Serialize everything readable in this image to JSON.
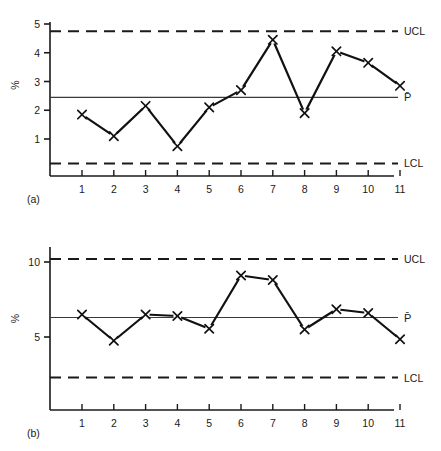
{
  "figure": {
    "title": "",
    "panels": [
      {
        "id": "a",
        "panel_label": "(a)",
        "ylabel": "%",
        "limit_labels": {
          "ucl": "UCL",
          "center": "P̄",
          "lcl": "LCL"
        }
      },
      {
        "id": "b",
        "panel_label": "(b)",
        "ylabel": "%",
        "limit_labels": {
          "ucl": "UCL",
          "center": "P̄",
          "lcl": "LCL"
        }
      }
    ]
  },
  "chart_data": [
    {
      "type": "line",
      "title": "",
      "subtitle": "",
      "panel": "(a)",
      "xlabel": "",
      "ylabel": "%",
      "categories": [
        "1",
        "2",
        "3",
        "4",
        "5",
        "6",
        "7",
        "8",
        "9",
        "10",
        "11"
      ],
      "x": [
        1,
        2,
        3,
        4,
        5,
        6,
        7,
        8,
        9,
        10,
        11
      ],
      "values": [
        1.85,
        1.1,
        2.15,
        0.75,
        2.1,
        2.7,
        4.45,
        1.9,
        4.05,
        3.65,
        2.85
      ],
      "marker": "x",
      "ylim": [
        0,
        5.3
      ],
      "yticks": [
        1,
        2,
        3,
        4,
        5
      ],
      "ytick_labels": [
        "1",
        "2",
        "3",
        "4",
        "5"
      ],
      "grid": false,
      "legend": "none",
      "control_limits": {
        "ucl": 4.75,
        "center": 2.45,
        "lcl": 0.15,
        "ucl_label": "UCL",
        "center_label": "P̄",
        "lcl_label": "LCL"
      }
    },
    {
      "type": "line",
      "title": "",
      "subtitle": "",
      "panel": "(b)",
      "xlabel": "",
      "ylabel": "%",
      "categories": [
        "1",
        "2",
        "3",
        "4",
        "5",
        "6",
        "7",
        "8",
        "9",
        "10",
        "11"
      ],
      "x": [
        1,
        2,
        3,
        4,
        5,
        6,
        7,
        8,
        9,
        10,
        11
      ],
      "values": [
        6.5,
        4.75,
        6.5,
        6.4,
        5.55,
        9.1,
        8.8,
        5.5,
        6.85,
        6.6,
        4.85
      ],
      "marker": "x",
      "ylim": [
        0,
        11.2
      ],
      "yticks": [
        5,
        10
      ],
      "ytick_labels": [
        "5",
        "10"
      ],
      "grid": false,
      "legend": "none",
      "control_limits": {
        "ucl": 10.2,
        "center": 6.3,
        "lcl": 2.3,
        "ucl_label": "UCL",
        "center_label": "P̄",
        "lcl_label": "LCL"
      }
    }
  ]
}
